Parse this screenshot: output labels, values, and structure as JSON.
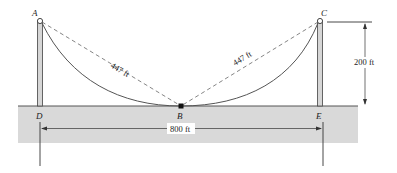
{
  "diagram": {
    "points": {
      "A": "A",
      "B": "B",
      "C": "C",
      "D": "D",
      "E": "E"
    },
    "dimensions": {
      "chord_left": "447 ft",
      "chord_right": "447 ft",
      "height": "200 ft",
      "span": "800 ft"
    },
    "colors": {
      "ground": "#d9d9d9",
      "pole": "#d0d0d0",
      "cable": "#555555",
      "line": "#333333"
    }
  }
}
